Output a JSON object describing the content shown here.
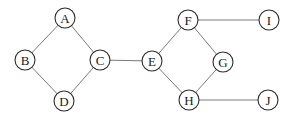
{
  "diagram": {
    "width": 293,
    "height": 118,
    "background_color": "#ffffff",
    "edge_color": "#7a7a7a",
    "node_fill_color": "#ffffff",
    "node_stroke_color": "#2b2b2b",
    "label_color": "#1a1a1a",
    "node_radius": 10,
    "nodes": [
      {
        "id": "A",
        "label": "A",
        "x": 65,
        "y": 18
      },
      {
        "id": "B",
        "label": "B",
        "x": 25,
        "y": 60
      },
      {
        "id": "C",
        "label": "C",
        "x": 100,
        "y": 60
      },
      {
        "id": "D",
        "label": "D",
        "x": 64,
        "y": 101
      },
      {
        "id": "E",
        "label": "E",
        "x": 152,
        "y": 61
      },
      {
        "id": "F",
        "label": "F",
        "x": 188,
        "y": 20
      },
      {
        "id": "G",
        "label": "G",
        "x": 223,
        "y": 62
      },
      {
        "id": "H",
        "label": "H",
        "x": 189,
        "y": 100
      },
      {
        "id": "I",
        "label": "I",
        "x": 269,
        "y": 20
      },
      {
        "id": "J",
        "label": "J",
        "x": 268,
        "y": 100
      }
    ],
    "edges": [
      {
        "from": "A",
        "to": "B"
      },
      {
        "from": "A",
        "to": "C"
      },
      {
        "from": "B",
        "to": "D"
      },
      {
        "from": "C",
        "to": "D"
      },
      {
        "from": "C",
        "to": "E"
      },
      {
        "from": "E",
        "to": "F"
      },
      {
        "from": "E",
        "to": "H"
      },
      {
        "from": "F",
        "to": "G"
      },
      {
        "from": "F",
        "to": "I"
      },
      {
        "from": "G",
        "to": "H"
      },
      {
        "from": "H",
        "to": "J"
      }
    ]
  }
}
